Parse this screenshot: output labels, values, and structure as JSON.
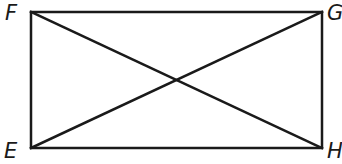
{
  "figure": {
    "type": "rectangle-with-diagonals",
    "stroke_color": "#1a1a1a",
    "background": "#ffffff",
    "vertices": {
      "F": {
        "label": "F",
        "x": 31,
        "y": 12,
        "position": "top-left"
      },
      "G": {
        "label": "G",
        "x": 322,
        "y": 12,
        "position": "top-right"
      },
      "H": {
        "label": "H",
        "x": 322,
        "y": 148,
        "position": "bottom-right"
      },
      "E": {
        "label": "E",
        "x": 31,
        "y": 148,
        "position": "bottom-left"
      }
    },
    "sides": [
      "FG",
      "GH",
      "HE",
      "EF"
    ],
    "diagonals": [
      "FH",
      "EG"
    ]
  }
}
